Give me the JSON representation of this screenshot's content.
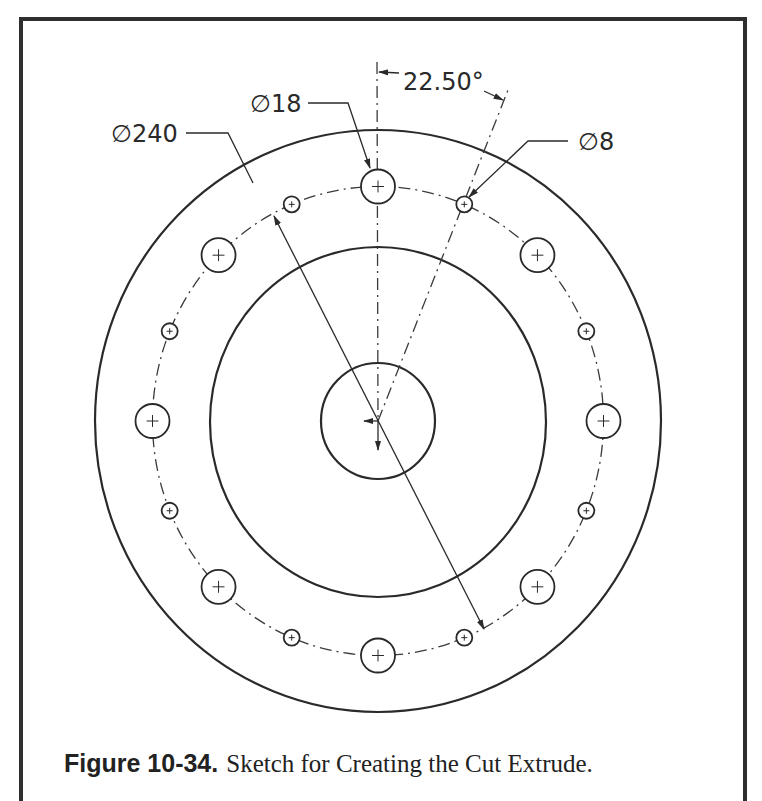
{
  "figure": {
    "number_label": "Figure 10-34.",
    "title": "Sketch for Creating the Cut Extrude."
  },
  "dimensions": {
    "outer_diameter_label": "∅240",
    "large_hole_label": "∅18",
    "small_hole_label": "∅8",
    "angle_label": "22.50°"
  },
  "geometry": {
    "center": [
      378,
      421
    ],
    "outer_circle_r": [
      283,
      291
    ],
    "middle_circle_r": [
      168,
      175
    ],
    "inner_circle_r": [
      57,
      58
    ],
    "bolt_circle_r": [
      225.5,
      234.5
    ],
    "large_hole_count": 8,
    "large_hole_r": 17,
    "large_hole_start_deg": 0,
    "small_hole_count": 8,
    "small_hole_r": 8,
    "small_hole_start_deg": 22.5
  },
  "colors": {
    "line": "#2a2a2a",
    "frame": "#2e2e2e",
    "background": "#ffffff"
  }
}
